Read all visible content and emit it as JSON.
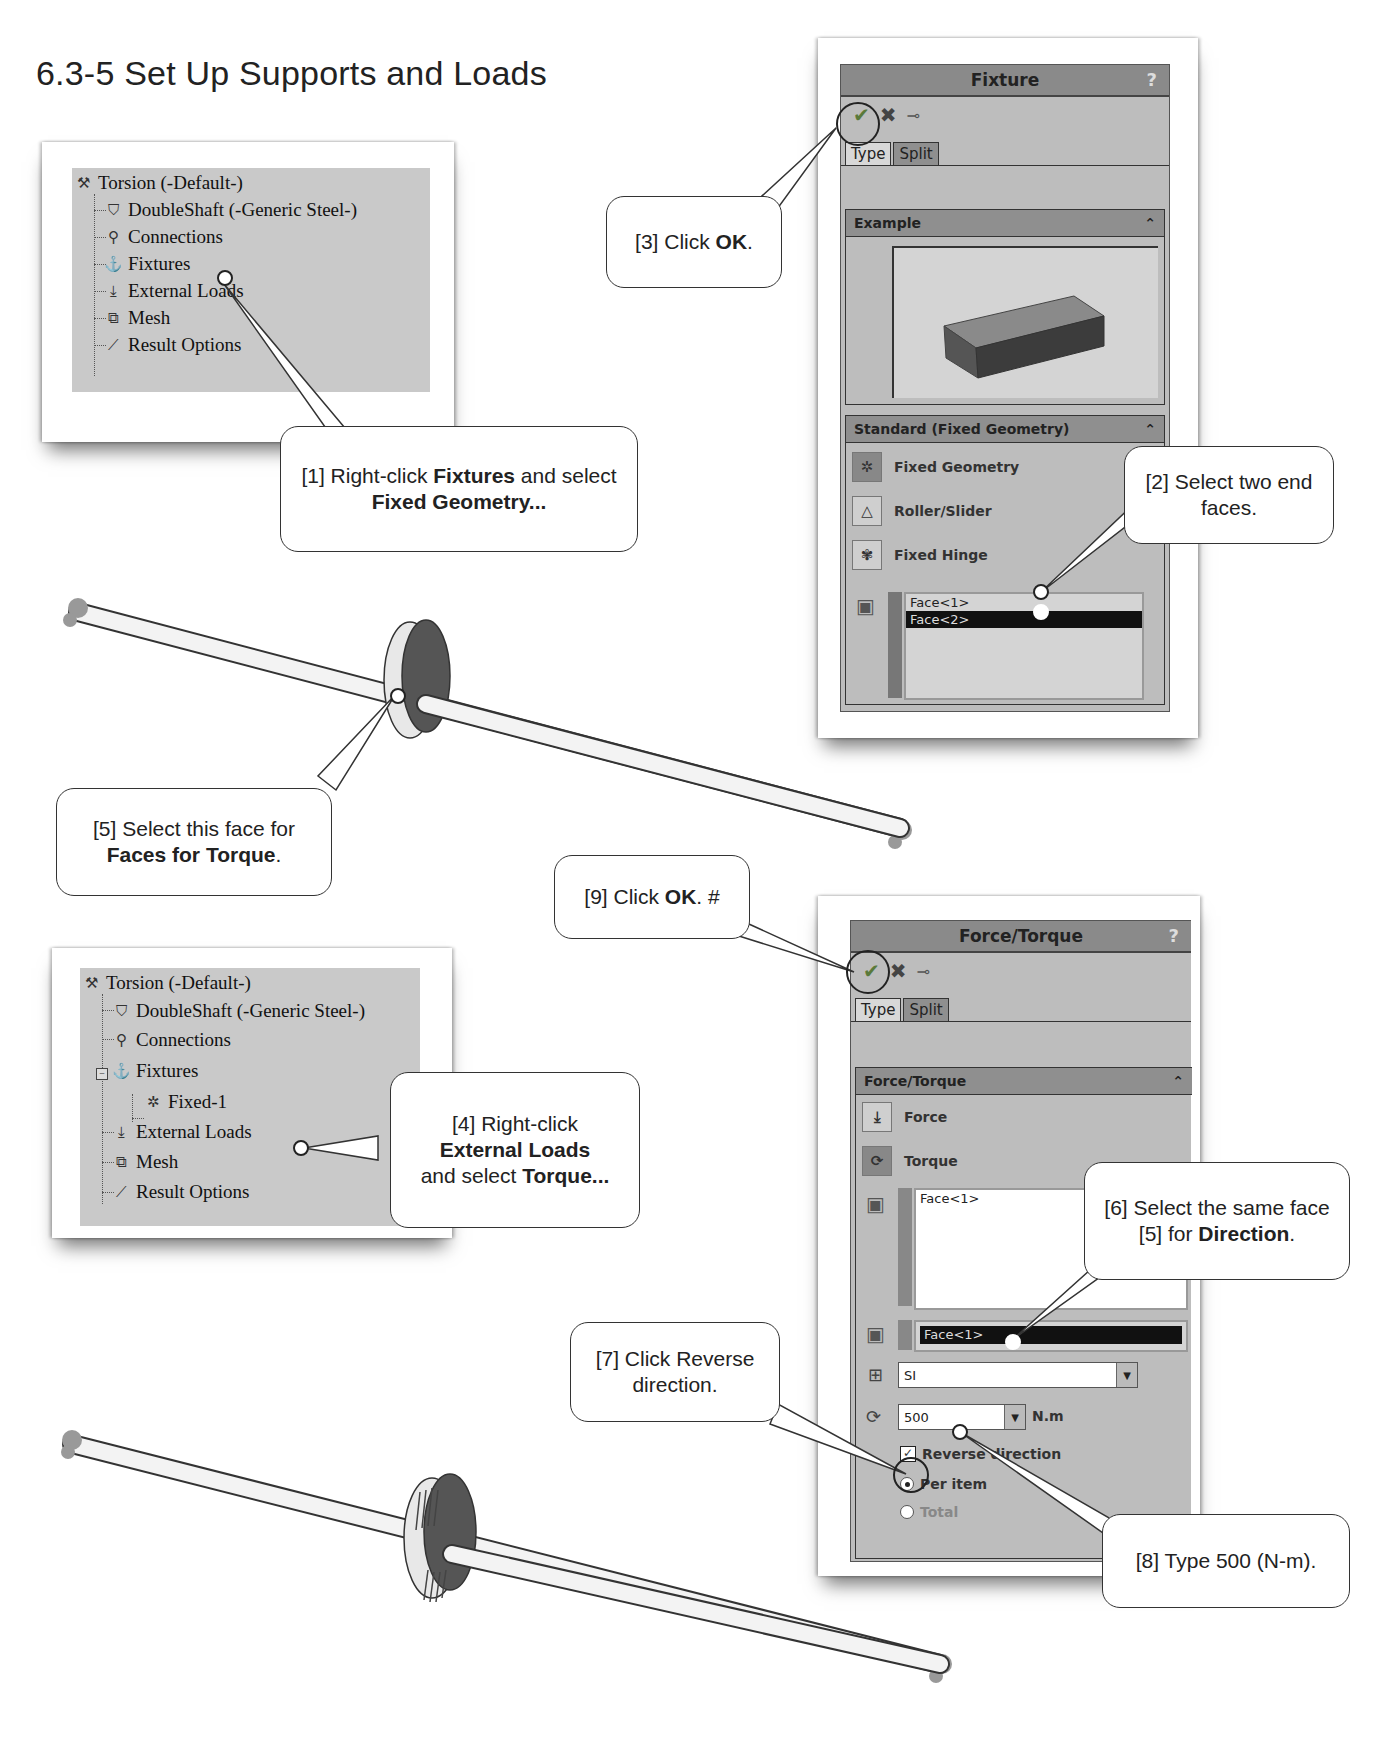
{
  "page": {
    "section_title": "6.3-5  Set Up Supports and Loads"
  },
  "tree1": {
    "items": [
      {
        "label": "Torsion (-Default-)",
        "icon": "study-icon"
      },
      {
        "label": "DoubleShaft (-Generic Steel-)",
        "icon": "part-icon"
      },
      {
        "label": "Connections",
        "icon": "connections-icon"
      },
      {
        "label": "Fixtures",
        "icon": "fixtures-icon"
      },
      {
        "label": "External Loads",
        "icon": "external-loads-icon"
      },
      {
        "label": "Mesh",
        "icon": "mesh-icon"
      },
      {
        "label": "Result Options",
        "icon": "result-options-icon"
      }
    ]
  },
  "tree2": {
    "items": [
      {
        "label": "Torsion (-Default-)",
        "icon": "study-icon"
      },
      {
        "label": "DoubleShaft (-Generic Steel-)",
        "icon": "part-icon"
      },
      {
        "label": "Connections",
        "icon": "connections-icon"
      },
      {
        "label": "Fixtures",
        "icon": "fixtures-icon",
        "expanded": true
      },
      {
        "label": "Fixed-1",
        "icon": "fixed-icon"
      },
      {
        "label": "External Loads",
        "icon": "external-loads-icon"
      },
      {
        "label": "Mesh",
        "icon": "mesh-icon"
      },
      {
        "label": "Result Options",
        "icon": "result-options-icon"
      }
    ]
  },
  "fixture_panel": {
    "title": "Fixture",
    "help": "?",
    "tabs": [
      "Type",
      "Split"
    ],
    "example_group": {
      "title": "Example"
    },
    "standard_group": {
      "title": "Standard (Fixed Geometry)",
      "options": [
        "Fixed Geometry",
        "Roller/Slider",
        "Fixed Hinge"
      ],
      "selected_option": "Fixed Geometry",
      "faces": [
        "Face<1>",
        "Face<2>"
      ]
    }
  },
  "force_panel": {
    "title": "Force/Torque",
    "help": "?",
    "tabs": [
      "Type",
      "Split"
    ],
    "group": {
      "title": "Force/Torque",
      "options": [
        "Force",
        "Torque"
      ],
      "selected_option": "Torque",
      "faces_for_torque": [
        "Face<1>"
      ],
      "direction_face": "Face<1>",
      "unit_system": "SI",
      "torque_value": "500",
      "torque_unit": "N.m",
      "reverse_direction_label": "Reverse direction",
      "reverse_direction_checked": true,
      "radio_per_item": "Per item",
      "radio_total": "Total",
      "radio_selected": "Per item"
    }
  },
  "callouts": {
    "c1": {
      "pre": "[1] Right-click ",
      "b1": "Fixtures",
      "mid": " and select ",
      "b2": "Fixed Geometry..."
    },
    "c2": {
      "text": "[2] Select two end faces."
    },
    "c3": {
      "pre": "[3] Click ",
      "b1": "OK",
      "post": "."
    },
    "c4": {
      "pre": "[4] Right-click ",
      "b1": "External Loads",
      "mid": " and select ",
      "b2": "Torque..."
    },
    "c5": {
      "pre": "[5] Select this face for ",
      "b1": "Faces for Torque",
      "post": "."
    },
    "c6": {
      "pre": "[6] Select the same face [5] for ",
      "b1": "Direction",
      "post": "."
    },
    "c7": {
      "text": "[7] Click Reverse direction."
    },
    "c8": {
      "text": "[8] Type 500 (N-m)."
    },
    "c9": {
      "pre": "[9] Click ",
      "b1": "OK",
      "post": ". #"
    }
  },
  "colors": {
    "panel_bg": "#bdbdbd",
    "panel_header": "#8a8a8a",
    "tree_bg": "#c9c9c9",
    "selection": "#111111"
  }
}
